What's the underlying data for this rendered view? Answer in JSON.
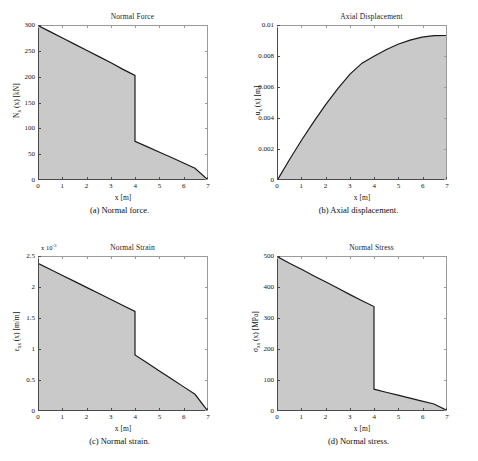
{
  "figure": {
    "background": "#ffffff",
    "fill_color": "#c9c9c9",
    "line_color": "#1a1a1a",
    "axis_color": "#4a4a4a"
  },
  "panels": [
    {
      "key": "a",
      "title": "Normal Force",
      "caption": "(a)  Normal force.",
      "xlabel": "x [m]",
      "ylabel_prefix": "N",
      "ylabel_sub": "x",
      "ylabel_suffix": " (x) [kN]",
      "ylabel_plain": "N_x (x) [kN]",
      "xticks": [
        "0",
        "1",
        "2",
        "3",
        "4",
        "5",
        "6",
        "7"
      ],
      "yticks": [
        "0",
        "50",
        "100",
        "150",
        "200",
        "250",
        "300"
      ],
      "exponent": ""
    },
    {
      "key": "b",
      "title": "Axial Displacement",
      "caption": "(b)  Axial displacement.",
      "xlabel": "x [m]",
      "ylabel_prefix": "u",
      "ylabel_sub": "x",
      "ylabel_suffix": " (x) [m]",
      "ylabel_plain": "u_x (x) [m]",
      "xticks": [
        "0",
        "1",
        "2",
        "3",
        "4",
        "5",
        "6",
        "7"
      ],
      "yticks": [
        "0",
        "0.002",
        "0.004",
        "0.006",
        "0.008",
        "0.01"
      ],
      "exponent": ""
    },
    {
      "key": "c",
      "title": "Normal Strain",
      "caption": "(c)  Normal strain.",
      "xlabel": "x [m]",
      "ylabel_prefix": "ε",
      "ylabel_sub": "xx",
      "ylabel_suffix": " (x) [m/m]",
      "ylabel_plain": "ε_xx (x) [m/m]",
      "xticks": [
        "0",
        "1",
        "2",
        "3",
        "4",
        "5",
        "6",
        "7"
      ],
      "yticks": [
        "0",
        "0.5",
        "1",
        "1.5",
        "2",
        "2.5"
      ],
      "exponent": "x 10",
      "exponent_power": "-3"
    },
    {
      "key": "d",
      "title": "Normal Stress",
      "caption": "(d)  Normal stress.",
      "xlabel": "x [m]",
      "ylabel_prefix": "σ",
      "ylabel_sub": "xx",
      "ylabel_suffix": " (x) [MPa]",
      "ylabel_plain": "σ_xx (x) [MPa]",
      "xticks": [
        "0",
        "1",
        "2",
        "3",
        "4",
        "5",
        "6",
        "7"
      ],
      "yticks": [
        "0",
        "100",
        "200",
        "300",
        "400",
        "500"
      ],
      "exponent": ""
    }
  ],
  "chart_data": [
    {
      "type": "area",
      "panel": "a",
      "title": "Normal Force",
      "xlabel": "x [m]",
      "ylabel": "N_x (x) [kN]",
      "xlim": [
        0,
        7
      ],
      "ylim": [
        0,
        300
      ],
      "grid": false,
      "legend": null,
      "discontinuity_at_x": 4,
      "series": [
        {
          "name": "N_x(x)",
          "x": [
            0,
            0.5,
            1,
            1.5,
            2,
            2.5,
            3,
            3.5,
            4,
            4,
            4.5,
            5,
            5.5,
            6,
            6.5,
            7
          ],
          "values": [
            300,
            288,
            276,
            264,
            252,
            240,
            228,
            215,
            203,
            74,
            63.5,
            53,
            42.5,
            32,
            21,
            0
          ]
        }
      ]
    },
    {
      "type": "area",
      "panel": "b",
      "title": "Axial Displacement",
      "xlabel": "x [m]",
      "ylabel": "u_x (x) [m]",
      "xlim": [
        0,
        7
      ],
      "ylim": [
        0,
        0.01
      ],
      "grid": false,
      "legend": null,
      "series": [
        {
          "name": "u_x(x)",
          "x": [
            0,
            0.5,
            1,
            1.5,
            2,
            2.5,
            3,
            3.5,
            4,
            4.5,
            5,
            5.5,
            6,
            6.5,
            7
          ],
          "values": [
            0,
            0.00132,
            0.00258,
            0.00377,
            0.00489,
            0.00593,
            0.00686,
            0.00757,
            0.00802,
            0.00845,
            0.00881,
            0.00908,
            0.00927,
            0.00937,
            0.00938
          ]
        }
      ]
    },
    {
      "type": "area",
      "panel": "c",
      "title": "Normal Strain",
      "xlabel": "x [m]",
      "ylabel": "ε_xx (x) [m/m]",
      "xlim": [
        0,
        7
      ],
      "ylim": [
        0,
        0.0025
      ],
      "y_scale_factor": "1e-3",
      "grid": false,
      "legend": null,
      "discontinuity_at_x": 4,
      "series": [
        {
          "name": "ε_xx(x)",
          "x": [
            0,
            0.5,
            1,
            1.5,
            2,
            2.5,
            3,
            3.5,
            4,
            4,
            4.5,
            5,
            5.5,
            6,
            6.5,
            7
          ],
          "values": [
            0.00239,
            0.002293,
            0.002195,
            0.002098,
            0.002,
            0.001903,
            0.001805,
            0.001708,
            0.00161,
            0.0009,
            0.000771,
            0.000643,
            0.000514,
            0.000386,
            0.000257,
            0
          ]
        }
      ]
    },
    {
      "type": "area",
      "panel": "d",
      "title": "Normal Stress",
      "xlabel": "x [m]",
      "ylabel": "σ_xx (x) [MPa]",
      "xlim": [
        0,
        7
      ],
      "ylim": [
        0,
        500
      ],
      "grid": false,
      "legend": null,
      "discontinuity_at_x": 4,
      "series": [
        {
          "name": "σ_xx(x)",
          "x": [
            0,
            0.5,
            1,
            1.5,
            2,
            2.5,
            3,
            3.5,
            4,
            4,
            4.5,
            5,
            5.5,
            6,
            6.5,
            7
          ],
          "values": [
            500,
            479,
            459,
            438,
            418,
            398,
            377,
            357,
            338,
            68,
            58,
            48.5,
            39,
            29,
            19.5,
            0
          ]
        }
      ]
    }
  ]
}
